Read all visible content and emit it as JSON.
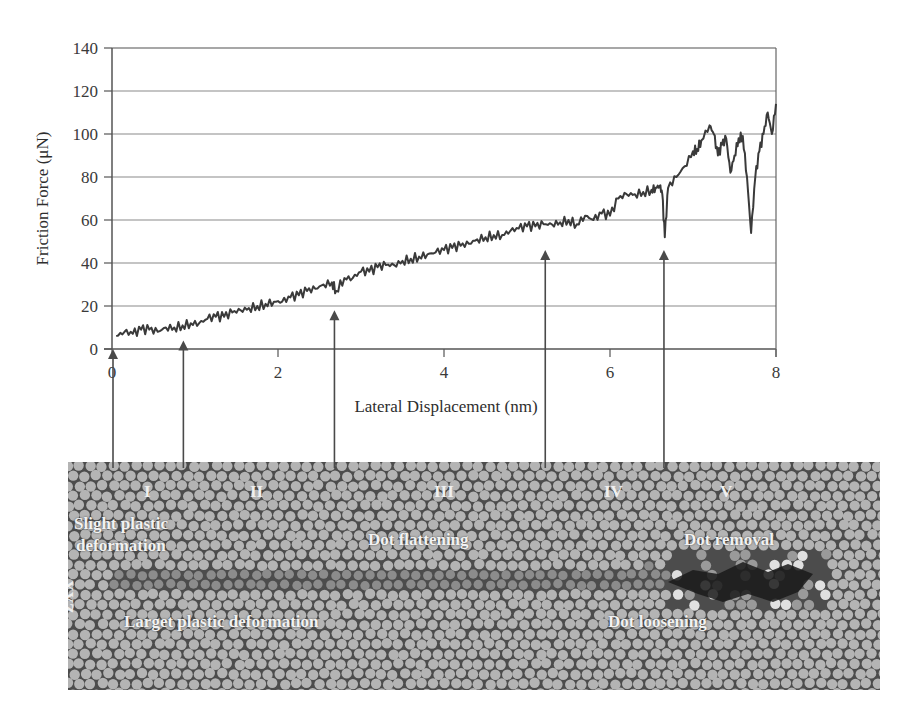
{
  "chart_data": {
    "type": "line",
    "title": "",
    "xlabel": "Lateral Displacement (nm)",
    "ylabel": "Friction Force (μN)",
    "xlim": [
      0,
      8
    ],
    "ylim": [
      0,
      140
    ],
    "xticks": [
      0,
      2,
      4,
      6,
      8
    ],
    "yticks": [
      0,
      20,
      40,
      60,
      80,
      100,
      120,
      140
    ],
    "grid": "horizontal",
    "legend": "none",
    "series": [
      {
        "name": "Friction Force",
        "color": "#3a3a3a",
        "x": [
          0.05,
          0.15,
          0.25,
          0.35,
          0.45,
          0.55,
          0.65,
          0.75,
          0.85,
          0.95,
          1.05,
          1.15,
          1.25,
          1.35,
          1.45,
          1.55,
          1.65,
          1.75,
          1.85,
          1.95,
          2.05,
          2.15,
          2.25,
          2.35,
          2.45,
          2.55,
          2.65,
          2.7,
          2.8,
          2.9,
          3.0,
          3.1,
          3.2,
          3.3,
          3.4,
          3.5,
          3.6,
          3.7,
          3.8,
          3.9,
          4.0,
          4.1,
          4.2,
          4.3,
          4.4,
          4.5,
          4.6,
          4.7,
          4.8,
          4.9,
          5.0,
          5.1,
          5.2,
          5.3,
          5.4,
          5.5,
          5.6,
          5.7,
          5.8,
          5.9,
          6.0,
          6.1,
          6.2,
          6.3,
          6.4,
          6.5,
          6.55,
          6.6,
          6.63,
          6.66,
          6.7,
          6.8,
          6.9,
          7.0,
          7.05,
          7.1,
          7.2,
          7.25,
          7.3,
          7.35,
          7.4,
          7.45,
          7.5,
          7.55,
          7.6,
          7.65,
          7.7,
          7.75,
          7.8,
          7.85,
          7.9,
          7.95,
          8.0
        ],
        "y": [
          6,
          8,
          7,
          9,
          9,
          8,
          10,
          10,
          11,
          12,
          12,
          14,
          15,
          15,
          17,
          18,
          19,
          20,
          21,
          22,
          22,
          24,
          25,
          27,
          28,
          30,
          31,
          27,
          33,
          33,
          36,
          36,
          38,
          39,
          39,
          41,
          42,
          43,
          44,
          45,
          46,
          47,
          48,
          49,
          51,
          52,
          53,
          53,
          55,
          56,
          57,
          57,
          58,
          58,
          59,
          60,
          58,
          62,
          60,
          63,
          62,
          70,
          72,
          72,
          73,
          74,
          75,
          76,
          72,
          52,
          75,
          80,
          85,
          92,
          93,
          97,
          104,
          100,
          90,
          95,
          98,
          82,
          90,
          98,
          99,
          80,
          54,
          80,
          92,
          100,
          110,
          100,
          114
        ]
      }
    ],
    "annotations": [
      {
        "type": "arrow",
        "x": 0.0,
        "y": 0,
        "target": "stage-start"
      },
      {
        "type": "arrow",
        "x": 0.86,
        "y": 4,
        "target": "stage-I-II boundary"
      },
      {
        "type": "arrow",
        "x": 2.68,
        "y": 18,
        "target": "stage-II-III boundary"
      },
      {
        "type": "arrow",
        "x": 5.22,
        "y": 46,
        "target": "stage-III-IV boundary"
      },
      {
        "type": "arrow",
        "x": 6.65,
        "y": 46,
        "target": "stage-IV-V boundary"
      }
    ]
  },
  "micrograph": {
    "axis_label": "XYZ",
    "stages": [
      "I",
      "II",
      "III",
      "IV",
      "V"
    ],
    "labels": {
      "slight_1": "Slight plastic",
      "slight_2": "deformation",
      "larger": "Larget plastic deformation",
      "flattening": "Dot flattening",
      "loosening": "Dot loosening",
      "removal": "Dot removal"
    }
  }
}
